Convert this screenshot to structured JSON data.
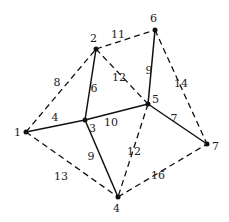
{
  "graph": {
    "nodes": [
      {
        "id": "1",
        "label": "1",
        "x": 26,
        "y": 132,
        "lx": 14,
        "ly": 136
      },
      {
        "id": "2",
        "label": "2",
        "x": 96,
        "y": 49,
        "lx": 90,
        "ly": 42
      },
      {
        "id": "3",
        "label": "3",
        "x": 85,
        "y": 120,
        "lx": 89,
        "ly": 132
      },
      {
        "id": "4",
        "label": "4",
        "x": 118,
        "y": 197,
        "lx": 113,
        "ly": 212
      },
      {
        "id": "5",
        "label": "5",
        "x": 148,
        "y": 104,
        "lx": 152,
        "ly": 103
      },
      {
        "id": "6",
        "label": "6",
        "x": 155,
        "y": 30,
        "lx": 150,
        "ly": 22
      },
      {
        "id": "7",
        "label": "7",
        "x": 207,
        "y": 144,
        "lx": 212,
        "ly": 150
      }
    ],
    "edges": [
      {
        "from": "1",
        "to": "3",
        "weight": "4",
        "style": "solid",
        "lx": 55,
        "ly": 121
      },
      {
        "from": "2",
        "to": "3",
        "weight": "6",
        "style": "solid",
        "lx": 94,
        "ly": 92
      },
      {
        "from": "3",
        "to": "5",
        "weight": "10",
        "style": "solid",
        "lx": 111,
        "ly": 126
      },
      {
        "from": "3",
        "to": "4",
        "weight": "9",
        "style": "solid",
        "lx": 91,
        "ly": 160
      },
      {
        "from": "5",
        "to": "6",
        "weight": "9",
        "style": "solid",
        "lx": 149,
        "ly": 74
      },
      {
        "from": "5",
        "to": "7",
        "weight": "7",
        "style": "solid",
        "lx": 174,
        "ly": 122
      },
      {
        "from": "1",
        "to": "2",
        "weight": "8",
        "style": "dashed",
        "lx": 57,
        "ly": 86
      },
      {
        "from": "2",
        "to": "6",
        "weight": "11",
        "style": "dashed",
        "lx": 118,
        "ly": 38
      },
      {
        "from": "2",
        "to": "5",
        "weight": "12",
        "style": "dashed",
        "lx": 119,
        "ly": 81
      },
      {
        "from": "6",
        "to": "7",
        "weight": "14",
        "style": "dashed",
        "lx": 181,
        "ly": 87
      },
      {
        "from": "1",
        "to": "4",
        "weight": "13",
        "style": "dashed",
        "lx": 61,
        "ly": 180
      },
      {
        "from": "5",
        "to": "4",
        "weight": "12",
        "style": "dashed",
        "lx": 134,
        "ly": 155
      },
      {
        "from": "4",
        "to": "7",
        "weight": "16",
        "style": "dashed",
        "lx": 158,
        "ly": 179
      }
    ]
  }
}
